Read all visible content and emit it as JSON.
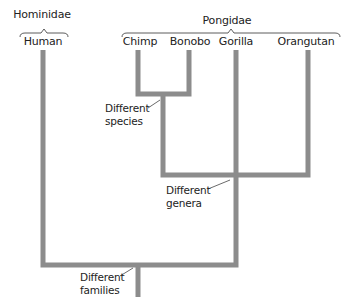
{
  "colors": {
    "branch": "#8c8c8c",
    "text": "#222222",
    "brace": "#333333",
    "leader": "#444444"
  },
  "families": [
    {
      "name": "Hominidae",
      "x": 42,
      "y": 11,
      "brace": {
        "x1": 20,
        "x2": 68,
        "y": 33
      }
    },
    {
      "name": "Pongidae",
      "x": 227,
      "y": 22,
      "brace": {
        "x1": 122,
        "x2": 340,
        "y": 33
      }
    }
  ],
  "species": [
    {
      "name": "Human",
      "label_x": 43,
      "line_x": 43,
      "top": 50
    },
    {
      "name": "Chimp",
      "label_x": 140,
      "line_x": 138,
      "top": 50
    },
    {
      "name": "Bonobo",
      "label_x": 190,
      "line_x": 189,
      "top": 50
    },
    {
      "name": "Gorilla",
      "label_x": 236,
      "line_x": 236,
      "top": 50
    },
    {
      "name": "Orangutan",
      "label_x": 307,
      "line_x": 308,
      "top": 50
    }
  ],
  "branches": {
    "species_bar": {
      "x1": 136,
      "x2": 191,
      "y": 94
    },
    "species_trunk": {
      "x": 163,
      "y1": 94,
      "y2": 175
    },
    "genera_bar": {
      "x1": 161,
      "x2": 310,
      "y": 175
    },
    "genera_trunk": {
      "x": 236,
      "y1": 50,
      "y2": 265
    },
    "family_bar": {
      "x1": 41,
      "x2": 238,
      "y": 265
    },
    "family_trunk": {
      "x": 138,
      "y1": 265,
      "y2": 297
    },
    "stroke_width": 5
  },
  "annotations": [
    {
      "id": "species",
      "line1": "Different",
      "line2": "species",
      "x": 105,
      "y": 103,
      "leader": {
        "x1": 148,
        "y1": 108,
        "x2": 160,
        "y2": 100
      }
    },
    {
      "id": "genera",
      "line1": "Different",
      "line2": "genera",
      "x": 166,
      "y": 186,
      "leader": {
        "x1": 208,
        "y1": 189,
        "x2": 230,
        "y2": 180
      }
    },
    {
      "id": "families",
      "line1": "Different",
      "line2": "families",
      "x": 80,
      "y": 271,
      "leader": {
        "x1": 120,
        "y1": 276,
        "x2": 133,
        "y2": 268
      }
    }
  ]
}
